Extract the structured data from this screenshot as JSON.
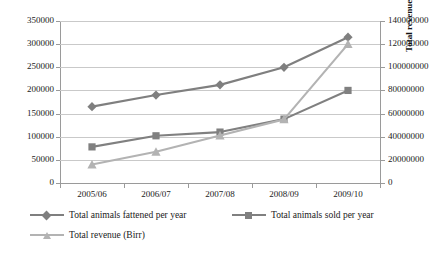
{
  "chart_data": {
    "type": "line",
    "title": "",
    "subtitle": "",
    "xlabel": "",
    "ylabel": "",
    "y2label": "Total revenue (Birr)",
    "categories": [
      "2005/06",
      "2006/07",
      "2007/08",
      "2008/09",
      "2009/10"
    ],
    "series": [
      {
        "name": "Total animals fattened per year",
        "axis": "left",
        "marker": "diamond",
        "color": "#7f7f7f",
        "values": [
          165000,
          190000,
          212000,
          250000,
          315000
        ]
      },
      {
        "name": "Total animals sold per year",
        "axis": "left",
        "marker": "square",
        "color": "#808080",
        "values": [
          78000,
          102000,
          110000,
          138000,
          200000
        ]
      },
      {
        "name": "Total revenue (Birr)",
        "axis": "right",
        "marker": "triangle",
        "color": "#b3b3b3",
        "values": [
          16000000,
          27000000,
          41000000,
          55000000,
          120000000
        ]
      }
    ],
    "ylim": [
      0,
      350000
    ],
    "y2lim": [
      0,
      140000000
    ],
    "yticks": [
      "0",
      "50000",
      "100000",
      "150000",
      "200000",
      "250000",
      "300000",
      "350000"
    ],
    "y2ticks": [
      "0",
      "20000000",
      "40000000",
      "60000000",
      "80000000",
      "100000000",
      "120000000",
      "140000000"
    ],
    "grid": true,
    "legend_position": "bottom"
  },
  "legend": {
    "entries": [
      "Total animals fattened per year",
      "Total animals sold per year",
      "Total revenue (Birr)"
    ]
  },
  "colors": {
    "series_fattened": "#7f7f7f",
    "series_sold": "#808080",
    "series_revenue": "#b3b3b3",
    "gridline": "#c9c9c9",
    "axis": "#9a9a9a",
    "background": "#ffffff"
  }
}
